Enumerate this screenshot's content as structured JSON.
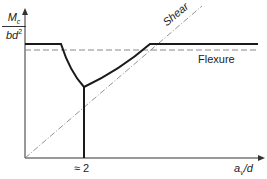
{
  "diagram": {
    "y_axis_label": {
      "numerator": "M",
      "numerator_sub": "c",
      "denominator": "bd",
      "denominator_sup": "2"
    },
    "x_axis_label": {
      "main": "a",
      "sub": "v",
      "rest": "/d"
    },
    "x_tick_label": "≈ 2",
    "curve_labels": {
      "shear": "Shear",
      "flexure": "Flexure"
    },
    "colors": {
      "line": "#1a1a1a",
      "dashed": "#888888",
      "axis": "#333333"
    }
  }
}
